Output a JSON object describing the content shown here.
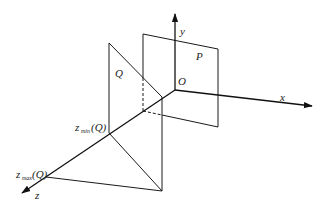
{
  "diagram": {
    "type": "3d-coordinate-projection",
    "axes": {
      "x_label": "x",
      "y_label": "y",
      "z_label": "z",
      "origin_label": "O"
    },
    "planes": {
      "p_label": "P",
      "q_label": "Q"
    },
    "annotations": {
      "z_min": {
        "base": "z",
        "subscript": "min",
        "arg": "(Q)"
      },
      "z_max": {
        "base": "z",
        "subscript": "max",
        "arg": "(Q)"
      }
    },
    "colors": {
      "line": "#1a1a1a",
      "background": "#ffffff"
    }
  }
}
